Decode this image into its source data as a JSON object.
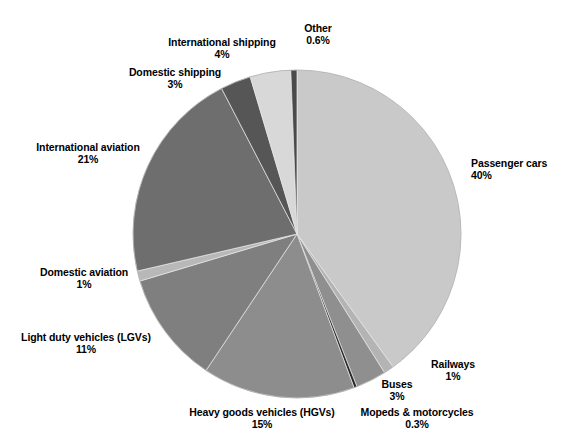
{
  "chart_data": {
    "type": "pie",
    "title": "",
    "subtitle": "",
    "xlabel": "",
    "ylabel": "",
    "legend_position": "none",
    "grid": false,
    "units": "%",
    "label_format": "name above value",
    "start_angle_deg": 0,
    "direction": "clockwise",
    "categories": [
      "Passenger cars",
      "Railways",
      "Buses",
      "Mopeds & motorcycles",
      "Heavy goods vehicles (HGVs)",
      "Light duty vehicles (LGVs)",
      "Domestic aviation",
      "International aviation",
      "Domestic shipping",
      "International shipping",
      "Other"
    ],
    "values": [
      40,
      1,
      3,
      0.3,
      15,
      11,
      1,
      21,
      3,
      4,
      0.6
    ],
    "value_labels": [
      "40%",
      "1%",
      "3%",
      "0.3%",
      "15%",
      "11%",
      "1%",
      "21%",
      "3%",
      "4%",
      "0.6%"
    ],
    "colors": [
      "#c9c9c9",
      "#b4b4b4",
      "#8f8f8f",
      "#2b2b2b",
      "#8d8d8d",
      "#7f7f7f",
      "#b8b8b8",
      "#6e6e6e",
      "#565656",
      "#d8d8d8",
      "#4a4a4a"
    ],
    "slices": [
      {
        "name": "Passenger cars",
        "value": 40,
        "value_label": "40%",
        "color": "#c9c9c9",
        "label_x": 471,
        "label_y": 157,
        "label_align": "left"
      },
      {
        "name": "Railways",
        "value": 1,
        "value_label": "1%",
        "color": "#b4b4b4",
        "label_x": 453,
        "label_y": 358,
        "label_align": "center"
      },
      {
        "name": "Buses",
        "value": 3,
        "value_label": "3%",
        "color": "#8f8f8f",
        "label_x": 397,
        "label_y": 378,
        "label_align": "center"
      },
      {
        "name": "Mopeds & motorcycles",
        "value": 0.3,
        "value_label": "0.3%",
        "color": "#2b2b2b",
        "label_x": 417,
        "label_y": 406,
        "label_align": "center"
      },
      {
        "name": "Heavy goods vehicles (HGVs)",
        "value": 15,
        "value_label": "15%",
        "color": "#8d8d8d",
        "label_x": 262,
        "label_y": 406,
        "label_align": "center"
      },
      {
        "name": "Light duty vehicles (LGVs)",
        "value": 11,
        "value_label": "11%",
        "color": "#7f7f7f",
        "label_x": 86,
        "label_y": 331,
        "label_align": "center"
      },
      {
        "name": "Domestic aviation",
        "value": 1,
        "value_label": "1%",
        "color": "#b8b8b8",
        "label_x": 84,
        "label_y": 266,
        "label_align": "center"
      },
      {
        "name": "International aviation",
        "value": 21,
        "value_label": "21%",
        "color": "#6e6e6e",
        "label_x": 88,
        "label_y": 141,
        "label_align": "center"
      },
      {
        "name": "Domestic shipping",
        "value": 3,
        "value_label": "3%",
        "color": "#565656",
        "label_x": 175,
        "label_y": 66,
        "label_align": "center"
      },
      {
        "name": "International shipping",
        "value": 4,
        "value_label": "4%",
        "color": "#d8d8d8",
        "label_x": 222,
        "label_y": 36,
        "label_align": "center"
      },
      {
        "name": "Other",
        "value": 0.6,
        "value_label": "0.6%",
        "color": "#4a4a4a",
        "label_x": 318,
        "label_y": 22,
        "label_align": "center"
      }
    ],
    "geometry": {
      "center_x": 297,
      "center_y": 234,
      "radius": 164
    }
  }
}
